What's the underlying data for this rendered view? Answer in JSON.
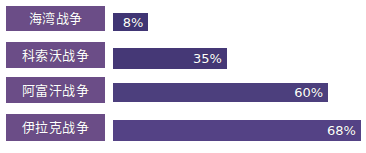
{
  "chart_data": {
    "type": "bar",
    "orientation": "horizontal",
    "title": "",
    "subtitle": "",
    "xlabel": "",
    "ylabel": "",
    "grid": false,
    "legend": false,
    "xlim": [
      0,
      75
    ],
    "categories": [
      "海湾战争",
      "科索沃战争",
      "阿富汗战争",
      "伊拉克战争"
    ],
    "values": [
      8,
      35,
      60,
      68
    ],
    "value_labels": [
      "8%",
      "35%",
      "60%",
      "68%"
    ],
    "unit": "%"
  },
  "bars": [
    {
      "label": "海湾战争",
      "value": 8,
      "value_label": "8%",
      "fill_percent": 14,
      "color": "#403574"
    },
    {
      "label": "科索沃战争",
      "value": 35,
      "value_label": "35%",
      "fill_percent": 45,
      "color": "#453876"
    },
    {
      "label": "阿富汗战争",
      "value": 60,
      "value_label": "60%",
      "fill_percent": 85,
      "color": "#4c3f7d"
    },
    {
      "label": "伊拉克战争",
      "value": 68,
      "value_label": "68%",
      "fill_percent": 98,
      "color": "#544285"
    }
  ],
  "colors": {
    "background": "#ffffff",
    "label_box": "#6b4d87",
    "bar_default": "#453876",
    "value_text": "#ffffff",
    "label_text": "#ffffff"
  }
}
